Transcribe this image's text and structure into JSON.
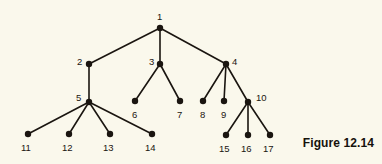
{
  "figure": {
    "caption": "Figure 12.14",
    "background_color": "#faf8ec",
    "ink_color": "#1a1510"
  },
  "chart_data": {
    "type": "diagram",
    "subtype": "rooted-tree",
    "title": "Figure 12.14",
    "root": "1",
    "nodes": [
      {
        "id": "1",
        "label": "1",
        "x": 160,
        "y": 28,
        "label_x": 157,
        "label_y": 12,
        "depth": 0
      },
      {
        "id": "2",
        "label": "2",
        "x": 89,
        "y": 64,
        "label_x": 77,
        "label_y": 57,
        "depth": 1
      },
      {
        "id": "3",
        "label": "3",
        "x": 160,
        "y": 64,
        "label_x": 149,
        "label_y": 57,
        "depth": 1
      },
      {
        "id": "4",
        "label": "4",
        "x": 226,
        "y": 64,
        "label_x": 232,
        "label_y": 57,
        "depth": 1
      },
      {
        "id": "5",
        "label": "5",
        "x": 89,
        "y": 102,
        "label_x": 76,
        "label_y": 93,
        "depth": 2
      },
      {
        "id": "6",
        "label": "6",
        "x": 135,
        "y": 101,
        "label_x": 132,
        "label_y": 110,
        "depth": 2
      },
      {
        "id": "7",
        "label": "7",
        "x": 180,
        "y": 101,
        "label_x": 177,
        "label_y": 110,
        "depth": 2
      },
      {
        "id": "8",
        "label": "8",
        "x": 203,
        "y": 101,
        "label_x": 200,
        "label_y": 110,
        "depth": 2
      },
      {
        "id": "9",
        "label": "9",
        "x": 224,
        "y": 101,
        "label_x": 221,
        "label_y": 110,
        "depth": 2
      },
      {
        "id": "10",
        "label": "10",
        "x": 248,
        "y": 102,
        "label_x": 256,
        "label_y": 93,
        "depth": 2
      },
      {
        "id": "11",
        "label": "11",
        "x": 28,
        "y": 134,
        "label_x": 21,
        "label_y": 143,
        "depth": 3
      },
      {
        "id": "12",
        "label": "12",
        "x": 69,
        "y": 134,
        "label_x": 62,
        "label_y": 143,
        "depth": 3
      },
      {
        "id": "13",
        "label": "13",
        "x": 110,
        "y": 134,
        "label_x": 103,
        "label_y": 143,
        "depth": 3
      },
      {
        "id": "14",
        "label": "14",
        "x": 152,
        "y": 134,
        "label_x": 145,
        "label_y": 143,
        "depth": 3
      },
      {
        "id": "15",
        "label": "15",
        "x": 226,
        "y": 135,
        "label_x": 219,
        "label_y": 144,
        "depth": 3
      },
      {
        "id": "16",
        "label": "16",
        "x": 248,
        "y": 135,
        "label_x": 241,
        "label_y": 144,
        "depth": 3
      },
      {
        "id": "17",
        "label": "17",
        "x": 270,
        "y": 135,
        "label_x": 263,
        "label_y": 144,
        "depth": 3
      }
    ],
    "edges": [
      {
        "from": "1",
        "to": "2"
      },
      {
        "from": "1",
        "to": "3"
      },
      {
        "from": "1",
        "to": "4"
      },
      {
        "from": "2",
        "to": "5"
      },
      {
        "from": "3",
        "to": "6"
      },
      {
        "from": "3",
        "to": "7"
      },
      {
        "from": "4",
        "to": "8"
      },
      {
        "from": "4",
        "to": "9"
      },
      {
        "from": "4",
        "to": "10"
      },
      {
        "from": "5",
        "to": "11"
      },
      {
        "from": "5",
        "to": "12"
      },
      {
        "from": "5",
        "to": "13"
      },
      {
        "from": "5",
        "to": "14"
      },
      {
        "from": "10",
        "to": "15"
      },
      {
        "from": "10",
        "to": "16"
      },
      {
        "from": "10",
        "to": "17"
      }
    ],
    "node_radius": 3.2,
    "edge_width": 1.6
  }
}
